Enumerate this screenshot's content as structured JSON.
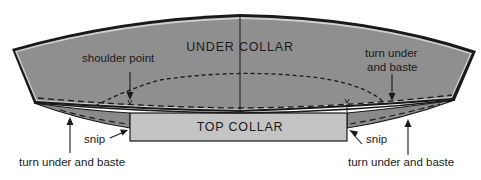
{
  "diagram": {
    "kind": "sewing-pattern-collar",
    "colors": {
      "under_collar_fill": "#8f8f8f",
      "top_collar_fill": "#c4c4c4",
      "flap_fill": "#8a8a8a",
      "outline": "#1a1a1a",
      "background": "#ffffff"
    },
    "labels": {
      "under_collar": "UNDER COLLAR",
      "top_collar": "TOP COLLAR",
      "shoulder_point": "shoulder point",
      "turn_under_upper_line1": "turn under",
      "turn_under_upper_line2": "and baste",
      "snip_left": "snip",
      "snip_right": "snip",
      "turn_under_bottom_left": "turn under and baste",
      "turn_under_bottom_right": "turn under and baste"
    }
  }
}
